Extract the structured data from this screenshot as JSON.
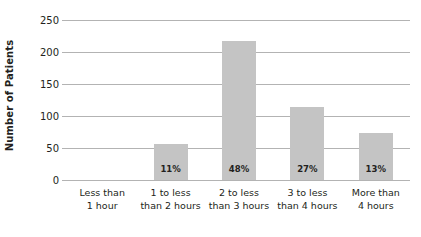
{
  "chart_data": {
    "type": "bar",
    "title": "",
    "xlabel": "",
    "ylabel": "Number of Patients",
    "ylim": [
      0,
      250
    ],
    "ytick_step": 50,
    "ytick_labels": [
      "250",
      "200",
      "150",
      "100",
      "50",
      "0"
    ],
    "grid": "horizontal",
    "legend": "none",
    "bar_color": "#c4c4c4",
    "gridline_color": "#b3b3b3",
    "text_color": "#231f20",
    "categories": [
      "Less than 1 hour",
      "1 to less than 2 hours",
      "2 to less than 3 hours",
      "3 to less than 4 hours",
      "More than 4 hours"
    ],
    "category_lines": [
      [
        "Less than",
        "1 hour"
      ],
      [
        "1 to less",
        "than 2 hours"
      ],
      [
        "2 to less",
        "than 3 hours"
      ],
      [
        "3 to less",
        "than 4 hours"
      ],
      [
        "More than",
        "4 hours"
      ]
    ],
    "values": [
      0,
      57,
      217,
      114,
      73
    ],
    "data_labels": [
      "",
      "11%",
      "48%",
      "27%",
      "13%"
    ]
  }
}
